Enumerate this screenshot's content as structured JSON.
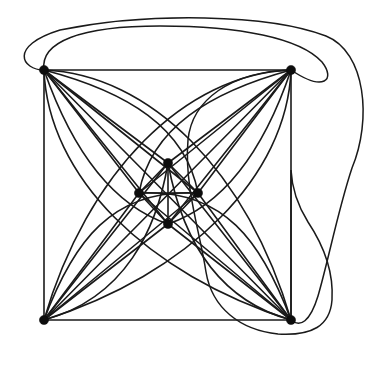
{
  "figure": {
    "background_color": "#ffffff",
    "stroke_color": "#1a1a1a",
    "canvas": {
      "width": 371,
      "height": 366
    }
  },
  "graph": {
    "vertex_radius": 4.6,
    "vertices": [
      {
        "id": "A",
        "name": "outer-top-left",
        "x": 44,
        "y": 70
      },
      {
        "id": "B",
        "name": "outer-top-right",
        "x": 291,
        "y": 70
      },
      {
        "id": "C",
        "name": "outer-bottom-right",
        "x": 291,
        "y": 320
      },
      {
        "id": "D",
        "name": "outer-bottom-left",
        "x": 44,
        "y": 320
      },
      {
        "id": "E",
        "name": "inner-top",
        "x": 168,
        "y": 163
      },
      {
        "id": "F",
        "name": "inner-right",
        "x": 198,
        "y": 193
      },
      {
        "id": "G",
        "name": "inner-bottom",
        "x": 168,
        "y": 224
      },
      {
        "id": "H",
        "name": "inner-left",
        "x": 139,
        "y": 193
      }
    ],
    "straight_edges": [
      {
        "from": "A",
        "to": "B",
        "d": "M 44 70 L 291 70"
      },
      {
        "from": "B",
        "to": "C",
        "d": "M 291 70 L 291 320"
      },
      {
        "from": "C",
        "to": "D",
        "d": "M 291 320 L 44 320"
      },
      {
        "from": "D",
        "to": "A",
        "d": "M 44 320 L 44 70"
      },
      {
        "from": "A",
        "to": "E",
        "d": "M 44 70 L 168 163"
      },
      {
        "from": "A",
        "to": "F",
        "d": "M 44 70 L 198 193"
      },
      {
        "from": "A",
        "to": "G",
        "d": "M 44 70 L 168 224"
      },
      {
        "from": "A",
        "to": "H",
        "d": "M 44 70 L 139 193"
      },
      {
        "from": "A",
        "to": "C",
        "d": "M 44 70 L 291 320"
      },
      {
        "from": "B",
        "to": "E",
        "d": "M 291 70 L 168 163"
      },
      {
        "from": "B",
        "to": "F",
        "d": "M 291 70 L 198 193"
      },
      {
        "from": "B",
        "to": "G",
        "d": "M 291 70 L 168 224"
      },
      {
        "from": "B",
        "to": "H",
        "d": "M 291 70 L 139 193"
      },
      {
        "from": "B",
        "to": "D",
        "d": "M 291 70 L 44 320"
      },
      {
        "from": "C",
        "to": "E",
        "d": "M 291 320 L 168 163"
      },
      {
        "from": "C",
        "to": "F",
        "d": "M 291 320 L 198 193"
      },
      {
        "from": "C",
        "to": "G",
        "d": "M 291 320 L 168 224"
      },
      {
        "from": "C",
        "to": "H",
        "d": "M 291 320 L 139 193"
      },
      {
        "from": "D",
        "to": "E",
        "d": "M 44 320 L 168 163"
      },
      {
        "from": "D",
        "to": "F",
        "d": "M 44 320 L 198 193"
      },
      {
        "from": "D",
        "to": "G",
        "d": "M 44 320 L 168 224"
      },
      {
        "from": "D",
        "to": "H",
        "d": "M 44 320 L 139 193"
      },
      {
        "from": "E",
        "to": "F",
        "d": "M 168 163 L 198 193"
      },
      {
        "from": "F",
        "to": "G",
        "d": "M 198 193 L 168 224"
      },
      {
        "from": "G",
        "to": "H",
        "d": "M 168 224 L 139 193"
      },
      {
        "from": "H",
        "to": "E",
        "d": "M 139 193 L 168 163"
      },
      {
        "from": "E",
        "to": "G",
        "d": "M 168 163 L 168 224"
      },
      {
        "from": "H",
        "to": "F",
        "d": "M 139 193 L 198 193"
      }
    ],
    "curved_edges": [
      {
        "from": "A",
        "to": "C",
        "name": "arc-tl-br-upper",
        "d": "M 44 70 C 150 74 248 172 291 320"
      },
      {
        "from": "A",
        "to": "C",
        "name": "arc-tl-br-lower",
        "d": "M 44 70 C 48 176 146 274 291 320"
      },
      {
        "from": "B",
        "to": "D",
        "name": "arc-tr-bl-upper",
        "d": "M 291 70 C 185 74 87 172 44 320"
      },
      {
        "from": "B",
        "to": "D",
        "name": "arc-tr-bl-lower",
        "d": "M 291 70 C 287 176 189 274 44 320"
      },
      {
        "from": "A",
        "to": "F",
        "name": "arc-tl-inner-right",
        "d": "M 44 70 C 128 92 186 128 198 193"
      },
      {
        "from": "A",
        "to": "G",
        "name": "arc-tl-inner-bottom",
        "d": "M 44 70 C 72 150 112 205 168 224"
      },
      {
        "from": "B",
        "to": "H",
        "name": "arc-tr-inner-left",
        "d": "M 291 70 C 210 92 151 128 139 193"
      },
      {
        "from": "B",
        "to": "G",
        "name": "arc-tr-inner-bottom",
        "d": "M 291 70 C 264 150 224 205 168 224"
      },
      {
        "from": "D",
        "to": "F",
        "name": "arc-bl-inner-right",
        "d": "M 44 320 C 73 242 112 188 198 193"
      },
      {
        "from": "D",
        "to": "E",
        "name": "arc-bl-inner-top",
        "d": "M 44 320 C 126 298 157 228 168 163"
      },
      {
        "from": "C",
        "to": "H",
        "name": "arc-br-inner-left",
        "d": "M 291 320 C 262 242 224 188 139 193"
      },
      {
        "from": "C",
        "to": "E",
        "name": "arc-br-inner-top",
        "d": "M 291 320 C 210 298 180 228 168 163"
      }
    ],
    "outer_arcs": [
      {
        "name": "outer-ellipse-large",
        "from": "A",
        "to": "C",
        "d": "M 44 70 C 22 70 8 46 60 30 C 150 12 268 14 326 36 C 366 52 372 120 352 168 C 338 210 328 262 318 296 C 310 322 300 328 291 320"
      },
      {
        "name": "outer-ellipse-right",
        "from": "B",
        "to": "C",
        "d": "M 291 70 C 230 72 192 100 188 140 C 184 186 200 232 206 272 C 212 308 240 330 278 334 C 312 336 330 326 332 300 C 334 268 320 240 308 222 C 298 206 292 190 291 170 L 291 320"
      },
      {
        "name": "outer-arc-top-inner",
        "from": "A",
        "to": "B",
        "d": "M 44 70 C 40 42 80 26 160 26 C 240 26 300 38 322 62 C 336 80 324 92 291 70"
      }
    ]
  }
}
